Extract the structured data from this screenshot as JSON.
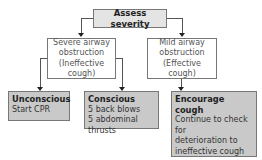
{
  "root": {
    "label": "Assess severity"
  },
  "branches": [
    {
      "id": "severe",
      "lines": [
        "Severe airway",
        "obstruction",
        "(Ineffective cough)"
      ],
      "outcomes": [
        {
          "title": "Unconscious",
          "lines": [
            "Start CPR"
          ]
        },
        {
          "title": "Conscious",
          "lines": [
            "5 back blows",
            "5 abdominal thrusts"
          ]
        }
      ]
    },
    {
      "id": "mild",
      "lines": [
        "Mild airway",
        "obstruction",
        "(Effective cough)"
      ],
      "outcomes": [
        {
          "title": "Encourage cough",
          "lines": [
            "Continue to check for",
            "deterioration to",
            "ineffective cough or",
            "relief of obstruction"
          ]
        }
      ]
    }
  ],
  "colors": {
    "shaded_fill": "#c9c9c9",
    "root_fill": "#e4e4e4",
    "border": "#777777",
    "connector": "#555555"
  }
}
